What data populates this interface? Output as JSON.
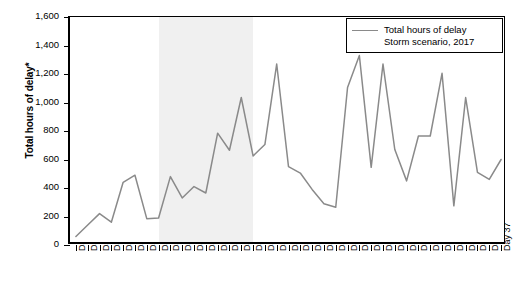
{
  "chart_data": {
    "type": "line",
    "title": "",
    "subtitle": "",
    "xlabel": "",
    "ylabel": "Total hours of delay*",
    "ylim": [
      0,
      1600
    ],
    "ytick_step": 200,
    "ytick_labels": [
      "0",
      "200",
      "400",
      "600",
      "800",
      "1,000",
      "1,200",
      "1,400",
      "1,600"
    ],
    "ytick_values": [
      0,
      200,
      400,
      600,
      800,
      1000,
      1200,
      1400,
      1600
    ],
    "grid": false,
    "legend_position": "top-right",
    "legend_entries": [
      "Total hours of delay",
      "Storm scenario, 2017"
    ],
    "categories": [
      "Day 1",
      "Day 2",
      "Day 3",
      "Day 4",
      "Day 5",
      "Day 6",
      "Day 7",
      "Day 8",
      "Day 9",
      "Day 10",
      "Day 11",
      "Day 12",
      "Day 13",
      "Day 14",
      "Day 15",
      "Day 16",
      "Day 17",
      "Day 18",
      "Day 19",
      "Day 20",
      "Day 21",
      "Day 22",
      "Day 23",
      "Day 24",
      "Day 25",
      "Day 26",
      "Day 27",
      "Day 28",
      "Day 29",
      "Day 30",
      "Day 31",
      "Day 32",
      "Day 33",
      "Day 34",
      "Day 35",
      "Day 36",
      "Day 37"
    ],
    "series": [
      {
        "name": "Total hours of delay",
        "color": "#8a8a8a",
        "values": [
          60,
          140,
          220,
          160,
          440,
          490,
          185,
          190,
          480,
          330,
          410,
          365,
          785,
          665,
          1035,
          625,
          705,
          1270,
          550,
          505,
          390,
          290,
          265,
          1105,
          1330,
          545,
          1270,
          670,
          450,
          765,
          765,
          1205,
          275,
          1035,
          510,
          460,
          600
        ]
      }
    ],
    "shaded_band": {
      "label": "storm period",
      "from_category": "Day 8",
      "to_category": "Day 16",
      "color": "#f0f0f0"
    }
  },
  "legend": {
    "line_label": "Total hours of delay",
    "scenario_label": "Storm scenario, 2017"
  },
  "axes": {
    "y_title": "Total hours of delay*"
  }
}
